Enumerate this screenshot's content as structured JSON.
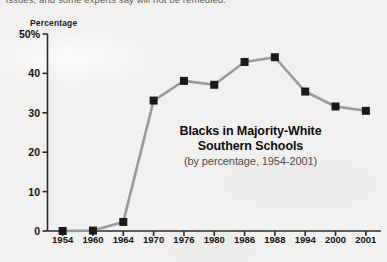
{
  "page": {
    "cutoff_body_text": "issues, and some experts say will not be remedied.",
    "background_color": "#f2f1ef",
    "ink_color": "#121212",
    "line_color": "#9a9a9a",
    "marker_color": "#1a1a1a"
  },
  "chart_data": {
    "type": "line",
    "title": "Blacks in Majority-White\nSouthern Schools",
    "title_line1": "Blacks in Majority-White",
    "title_line2": "Southern Schools",
    "subtitle": "(by percentage, 1954-2001)",
    "ylabel": "Percentage",
    "xlabel": "",
    "ylim": [
      0,
      50
    ],
    "yticks": [
      0,
      10,
      20,
      30,
      40,
      50
    ],
    "ytick_labels": [
      "0",
      "10",
      "20",
      "30",
      "40",
      "50%"
    ],
    "grid": false,
    "legend": "none",
    "categories": [
      "1954",
      "1960",
      "1964",
      "1970",
      "1976",
      "1980",
      "1986",
      "1988",
      "1994",
      "2000",
      "2001"
    ],
    "x": [
      1954,
      1960,
      1964,
      1970,
      1976,
      1980,
      1986,
      1988,
      1994,
      2000,
      2001
    ],
    "values": [
      0.001,
      0.1,
      2.3,
      33.1,
      38.1,
      37.1,
      42.9,
      44.1,
      35.4,
      31.6,
      30.5
    ],
    "series": [
      {
        "name": "Blacks in majority-white southern schools",
        "values": [
          0.001,
          0.1,
          2.3,
          33.1,
          38.1,
          37.1,
          42.9,
          44.1,
          35.4,
          31.6,
          30.5
        ]
      }
    ],
    "marker": "square",
    "marker_size": 8
  }
}
